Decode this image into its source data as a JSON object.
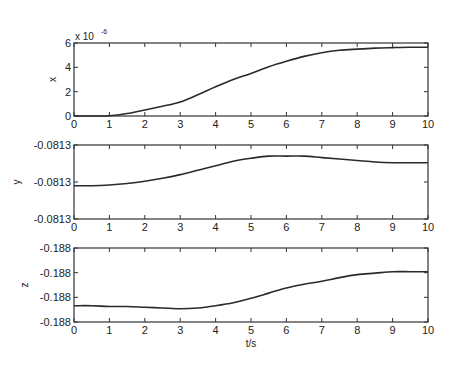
{
  "chart_data": [
    {
      "type": "line",
      "panel": "top",
      "title": "",
      "xlabel": "",
      "ylabel": "x",
      "y_multiplier_label": "x 10",
      "y_multiplier_exponent": "-6",
      "xlim": [
        0,
        10
      ],
      "ylim": [
        0,
        6
      ],
      "x_ticks": [
        "0",
        "1",
        "2",
        "3",
        "4",
        "5",
        "6",
        "7",
        "8",
        "9",
        "10"
      ],
      "y_ticks": [
        "0",
        "2",
        "4",
        "6"
      ],
      "grid": false,
      "x": [
        0,
        0.5,
        1,
        1.5,
        2,
        2.5,
        3,
        3.5,
        4,
        4.5,
        5,
        5.5,
        6,
        6.5,
        7,
        7.5,
        8,
        8.5,
        9,
        9.5,
        10
      ],
      "series": [
        {
          "name": "x",
          "values": [
            0,
            0,
            0.02,
            0.2,
            0.5,
            0.8,
            1.15,
            1.75,
            2.4,
            3.0,
            3.5,
            4.05,
            4.5,
            4.9,
            5.2,
            5.4,
            5.5,
            5.58,
            5.62,
            5.65,
            5.65
          ]
        }
      ]
    },
    {
      "type": "line",
      "panel": "middle",
      "title": "",
      "xlabel": "",
      "ylabel": "y",
      "xlim": [
        0,
        10
      ],
      "ylim_fraction": [
        0,
        1
      ],
      "x_ticks": [
        "0",
        "1",
        "2",
        "3",
        "4",
        "5",
        "6",
        "7",
        "8",
        "9",
        "10"
      ],
      "y_ticks": [
        "-0.0813",
        "-0.0813",
        "-0.0813"
      ],
      "grid": false,
      "x": [
        0,
        0.5,
        1,
        1.5,
        2,
        2.5,
        3,
        3.5,
        4,
        4.5,
        5,
        5.5,
        6,
        6.5,
        7,
        7.5,
        8,
        8.5,
        9,
        9.5,
        10
      ],
      "series": [
        {
          "name": "y (fraction of axis height)",
          "values": [
            0.45,
            0.45,
            0.46,
            0.48,
            0.51,
            0.55,
            0.6,
            0.66,
            0.72,
            0.78,
            0.82,
            0.85,
            0.85,
            0.85,
            0.83,
            0.81,
            0.79,
            0.77,
            0.76,
            0.76,
            0.76
          ]
        }
      ]
    },
    {
      "type": "line",
      "panel": "bottom",
      "title": "",
      "xlabel": "t/s",
      "ylabel": "z",
      "xlim": [
        0,
        10
      ],
      "ylim_fraction": [
        0,
        1
      ],
      "x_ticks": [
        "0",
        "1",
        "2",
        "3",
        "4",
        "5",
        "6",
        "7",
        "8",
        "9",
        "10"
      ],
      "y_ticks": [
        "-0.188",
        "-0.188",
        "-0.188",
        "-0.188"
      ],
      "grid": false,
      "x": [
        0,
        0.5,
        1,
        1.5,
        2,
        2.5,
        3,
        3.5,
        4,
        4.5,
        5,
        5.5,
        6,
        6.5,
        7,
        7.5,
        8,
        8.5,
        9,
        9.5,
        10
      ],
      "series": [
        {
          "name": "z (fraction of axis height)",
          "values": [
            0.22,
            0.22,
            0.21,
            0.21,
            0.2,
            0.19,
            0.18,
            0.19,
            0.22,
            0.26,
            0.32,
            0.39,
            0.46,
            0.51,
            0.55,
            0.6,
            0.64,
            0.66,
            0.68,
            0.68,
            0.68
          ]
        }
      ]
    }
  ]
}
